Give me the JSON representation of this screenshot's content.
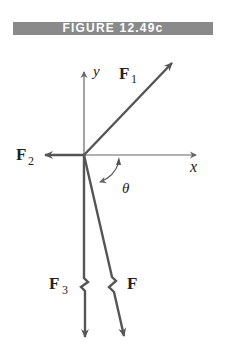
{
  "figure": {
    "title": "FIGURE 12.49c",
    "labels": {
      "y_axis": "y",
      "x_axis": "x",
      "angle": "θ",
      "F1": "F",
      "F1_sub": "1",
      "F2": "F",
      "F2_sub": "2",
      "F3": "F",
      "F3_sub": "3",
      "F": "F"
    },
    "colors": {
      "banner": "#8a8a8a",
      "vector": "#555555",
      "axis": "#666666"
    }
  }
}
